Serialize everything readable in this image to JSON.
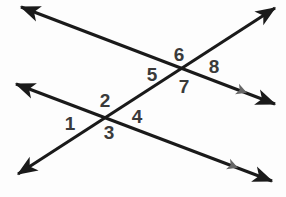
{
  "diagram": {
    "type": "geometry-line-diagram",
    "canvas": {
      "width": 286,
      "height": 197
    },
    "colors": {
      "background": "#fdfdfd",
      "line": "#1a1a1a",
      "label": "#3a3a3a",
      "parallel_marker": "#666666"
    },
    "lines": [
      {
        "id": "line-parallel-upper",
        "role": "parallel-line",
        "description": "Upper descending line, double-headed arrow",
        "start": {
          "x": 21,
          "y": 7
        },
        "end": {
          "x": 275,
          "y": 104
        },
        "arrow_start": true,
        "arrow_end": true,
        "marker": {
          "x": 237,
          "y": 89,
          "color": "#666666"
        }
      },
      {
        "id": "line-parallel-lower",
        "role": "parallel-line",
        "description": "Lower descending line, double-headed arrow",
        "start": {
          "x": 16,
          "y": 84
        },
        "end": {
          "x": 272,
          "y": 181
        },
        "arrow_start": true,
        "arrow_end": true,
        "marker": {
          "x": 228,
          "y": 164,
          "color": "#666666"
        }
      },
      {
        "id": "line-transversal",
        "role": "transversal",
        "description": "Ascending transversal line, double-headed arrow",
        "start": {
          "x": 18,
          "y": 174
        },
        "end": {
          "x": 275,
          "y": 8
        },
        "arrow_start": true,
        "arrow_end": true,
        "marker": null
      }
    ],
    "intersections": [
      {
        "id": "intersection-lower",
        "x": 111,
        "y": 117,
        "lines": [
          "line-parallel-lower",
          "line-transversal"
        ]
      },
      {
        "id": "intersection-upper",
        "x": 181,
        "y": 70,
        "lines": [
          "line-parallel-upper",
          "line-transversal"
        ]
      }
    ],
    "labels": [
      {
        "id": "angle-1",
        "text": "1",
        "x": 70,
        "y": 123,
        "intersection": "intersection-lower",
        "position": "left"
      },
      {
        "id": "angle-2",
        "text": "2",
        "x": 105,
        "y": 100,
        "intersection": "intersection-lower",
        "position": "top"
      },
      {
        "id": "angle-3",
        "text": "3",
        "x": 109,
        "y": 132,
        "intersection": "intersection-lower",
        "position": "bottom"
      },
      {
        "id": "angle-4",
        "text": "4",
        "x": 137,
        "y": 116,
        "intersection": "intersection-lower",
        "position": "right"
      },
      {
        "id": "angle-5",
        "text": "5",
        "x": 152,
        "y": 74,
        "intersection": "intersection-upper",
        "position": "left"
      },
      {
        "id": "angle-6",
        "text": "6",
        "x": 179,
        "y": 54,
        "intersection": "intersection-upper",
        "position": "top"
      },
      {
        "id": "angle-7",
        "text": "7",
        "x": 184,
        "y": 86,
        "intersection": "intersection-upper",
        "position": "bottom"
      },
      {
        "id": "angle-8",
        "text": "8",
        "x": 214,
        "y": 66,
        "intersection": "intersection-upper",
        "position": "right"
      }
    ]
  }
}
